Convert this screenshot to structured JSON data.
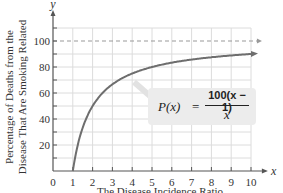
{
  "chart_data": {
    "type": "line",
    "title": "",
    "xlabel": "The Disease Incidence Ratio",
    "ylabel": "Percentage of Deaths from the Disease That Are Smoking Related",
    "ylabel_lines": [
      "Percentage of Deaths from the",
      "Disease That Are Smoking Related"
    ],
    "x_axis_symbol": "x",
    "y_axis_symbol": "y",
    "xlim": [
      0,
      10
    ],
    "ylim": [
      0,
      110
    ],
    "x_ticks": [
      0,
      1,
      2,
      3,
      4,
      5,
      6,
      7,
      8,
      9,
      10
    ],
    "y_ticks": [
      20,
      40,
      60,
      80,
      100
    ],
    "grid": true,
    "asymptote": {
      "y": 100,
      "style": "dashed"
    },
    "function": "P(x) = 100(x - 1)/x",
    "series": [
      {
        "name": "P(x)",
        "x": [
          1,
          1.25,
          1.5,
          2,
          2.5,
          3,
          4,
          5,
          6,
          7,
          8,
          9,
          10
        ],
        "values": [
          0,
          20,
          33.3,
          50,
          60,
          66.7,
          75,
          80,
          83.3,
          85.7,
          87.5,
          88.9,
          90
        ]
      }
    ],
    "annotation": {
      "lhs": "P(x)",
      "equals": "=",
      "numerator": "100(x − 1)",
      "denominator": "x"
    },
    "colors": {
      "curve": "#6e6e6e",
      "grid": "#dcdcdc",
      "axis": "#555555",
      "asymptote": "#999999",
      "formula_box": "#ececec"
    }
  }
}
